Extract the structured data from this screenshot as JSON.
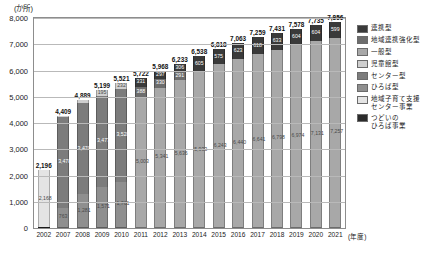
{
  "axis": {
    "y_unit": "(か所)",
    "x_unit": "(年度)",
    "y_ticks": [
      "8,000",
      "7,000",
      "6,000",
      "5,000",
      "4,000",
      "3,000",
      "2,000",
      "1,000",
      "0"
    ]
  },
  "legend": {
    "items": [
      {
        "label": "連携型",
        "color": "#3a3a3a"
      },
      {
        "label": "地域連携強化型",
        "color": "#6d6d6d"
      },
      {
        "label": "一般型",
        "color": "#a8a8a8"
      },
      {
        "label": "児童館型",
        "color": "#cfcfcf"
      },
      {
        "label": "センター型",
        "color": "#7c7c7c"
      },
      {
        "label": "ひろば型",
        "color": "#8f8f8f"
      },
      {
        "label": "地域子育て支援\nセンター事業",
        "color": "#e4e4e4"
      },
      {
        "label": "つどいの\nひろば事業",
        "color": "#2b2b2b"
      }
    ]
  },
  "chart_data": {
    "type": "bar",
    "subtype": "stacked",
    "title": "",
    "xlabel": "(年度)",
    "ylabel": "(か所)",
    "ylim": [
      0,
      8000
    ],
    "ytick_step": 1000,
    "grid": true,
    "legend_position": "right",
    "categories": [
      "2002",
      "2007",
      "2008",
      "2009",
      "2010",
      "2011",
      "2012",
      "2013",
      "2014",
      "2015",
      "2016",
      "2017",
      "2018",
      "2019",
      "2020",
      "2021"
    ],
    "totals": [
      2196,
      4409,
      4889,
      5199,
      5521,
      5722,
      5968,
      6233,
      6538,
      6818,
      7063,
      7259,
      7431,
      7578,
      7735,
      7856
    ],
    "series": [
      {
        "name": "つどいのひろば事業",
        "color": "#2b2b2b",
        "values": [
          28,
          0,
          0,
          0,
          0,
          0,
          0,
          0,
          0,
          0,
          0,
          0,
          0,
          0,
          0,
          0
        ]
      },
      {
        "name": "地域子育て支援センター事業",
        "color": "#e4e4e4",
        "values": [
          2168,
          0,
          0,
          0,
          0,
          0,
          0,
          0,
          0,
          0,
          0,
          0,
          0,
          0,
          0,
          0
        ]
      },
      {
        "name": "ひろば型",
        "color": "#8f8f8f",
        "values": [
          0,
          763,
          1281,
          1571,
          1761,
          0,
          0,
          0,
          0,
          0,
          0,
          0,
          0,
          0,
          0,
          0
        ]
      },
      {
        "name": "センター型",
        "color": "#7c7c7c",
        "values": [
          0,
          3478,
          3470,
          3477,
          3528,
          0,
          0,
          0,
          0,
          0,
          0,
          0,
          0,
          0,
          0,
          0
        ]
      },
      {
        "name": "児童館型",
        "color": "#cfcfcf",
        "values": [
          0,
          28,
          138,
          195,
          232,
          0,
          0,
          0,
          0,
          0,
          0,
          0,
          0,
          0,
          0,
          0
        ]
      },
      {
        "name": "一般型",
        "color": "#a8a8a8",
        "values": [
          0,
          0,
          0,
          0,
          0,
          5003,
          5341,
          5636,
          5933,
          6243,
          6440,
          6641,
          6798,
          6974,
          7131,
          7257
        ]
      },
      {
        "name": "地域連携強化型",
        "color": "#6d6d6d",
        "values": [
          0,
          0,
          0,
          0,
          0,
          388,
          330,
          291,
          0,
          0,
          0,
          0,
          0,
          0,
          0,
          0
        ]
      },
      {
        "name": "連携型",
        "color": "#3a3a3a",
        "values": [
          0,
          0,
          0,
          0,
          0,
          331,
          297,
          306,
          605,
          575,
          623,
          618,
          633,
          604,
          604,
          599
        ]
      }
    ],
    "bar_segment_labels": {
      "2002": [
        "2,168",
        "28"
      ],
      "2007": [
        "3,478",
        "763",
        "28"
      ],
      "2008": [
        "3,470",
        "1,281",
        "138"
      ],
      "2009": [
        "3,477",
        "1,571",
        "195"
      ],
      "2010": [
        "3,528",
        "1,761",
        "232"
      ],
      "2011": [
        "5,003",
        "388",
        "331"
      ],
      "2012": [
        "5,341",
        "330",
        "297"
      ],
      "2013": [
        "5,636",
        "291",
        "306"
      ],
      "2014": [
        "5,933",
        "605"
      ],
      "2015": [
        "6,243",
        "575"
      ],
      "2016": [
        "6,440",
        "623"
      ],
      "2017": [
        "6,641",
        "618"
      ],
      "2018": [
        "6,798",
        "633"
      ],
      "2019": [
        "6,974",
        "604"
      ],
      "2020": [
        "7,131",
        "604"
      ],
      "2021": [
        "7,257",
        "599"
      ]
    }
  }
}
